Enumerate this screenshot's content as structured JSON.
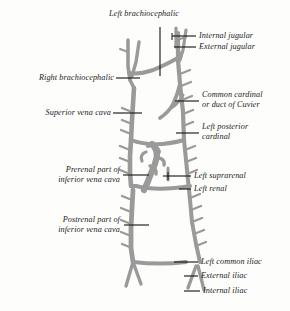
{
  "figure": {
    "kind": "anatomical-diagram",
    "style": "engraved line drawing, gray vessels, italic serif labels with leader lines",
    "background_color": "#fdfdfb",
    "vessel_color": "#9a9a9a",
    "vessel_color_dark": "#8a8a8a",
    "leader_color": "#1d1b19",
    "text_color": "#23211f"
  },
  "labels": {
    "left_brachiocephalic": "Left brachiocephalic",
    "internal_jugular": "Internal jugular",
    "external_jugular": "External jugular",
    "right_brachiocephalic": "Right brachiocephalic",
    "common_cardinal_1": "Common cardinal",
    "common_cardinal_2": "or duct of Cuvier",
    "superior_vena_cava": "Superior vena cava",
    "left_posterior_cardinal_1": "Left posterior",
    "left_posterior_cardinal_2": "cardinal",
    "prerenal_ivc_1": "Prerenal part of",
    "prerenal_ivc_2": "inferior vena cava",
    "left_suprarenal": "Left suprarenal",
    "left_renal": "Left renal",
    "postrenal_ivc_1": "Postrenal part of",
    "postrenal_ivc_2": "inferior vena cava",
    "left_common_iliac": "Left common iliac",
    "external_iliac": "External iliac",
    "internal_iliac": "Internal iliac"
  }
}
